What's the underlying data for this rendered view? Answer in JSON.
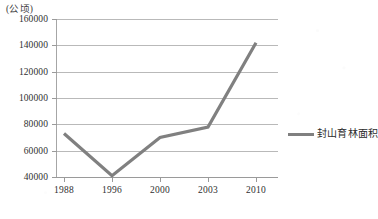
{
  "chart_data": {
    "type": "line",
    "title": "",
    "subtitle": "",
    "xlabel": "",
    "ylabel": "(公顷)",
    "y_unit_title": "(公顷)",
    "categories": [
      "1988",
      "1996",
      "2000",
      "2003",
      "2010"
    ],
    "series": [
      {
        "name": "封山育林面积",
        "color": "#808080",
        "values": [
          73000,
          41000,
          70000,
          78000,
          142000
        ]
      }
    ],
    "ylim": [
      40000,
      160000
    ],
    "y_ticks": [
      160000,
      140000,
      120000,
      100000,
      80000,
      60000,
      40000
    ],
    "y_tick_labels": [
      "160000",
      "140000",
      "120000",
      "100000",
      "80000",
      "60000",
      "40000"
    ],
    "x_tick_labels": [
      "1988",
      "1996",
      "2000",
      "2003",
      "2010"
    ],
    "grid": true,
    "grid_axis": "y",
    "legend": {
      "position": "right",
      "entries": [
        {
          "label": "封山育林面积",
          "color": "#808080",
          "marker": "line"
        }
      ]
    },
    "colors": {
      "series_line": "#808080",
      "gridline": "#b9b9b9",
      "axis": "#9a9a9a",
      "text": "#2f2f2f",
      "background": "#ffffff"
    }
  }
}
